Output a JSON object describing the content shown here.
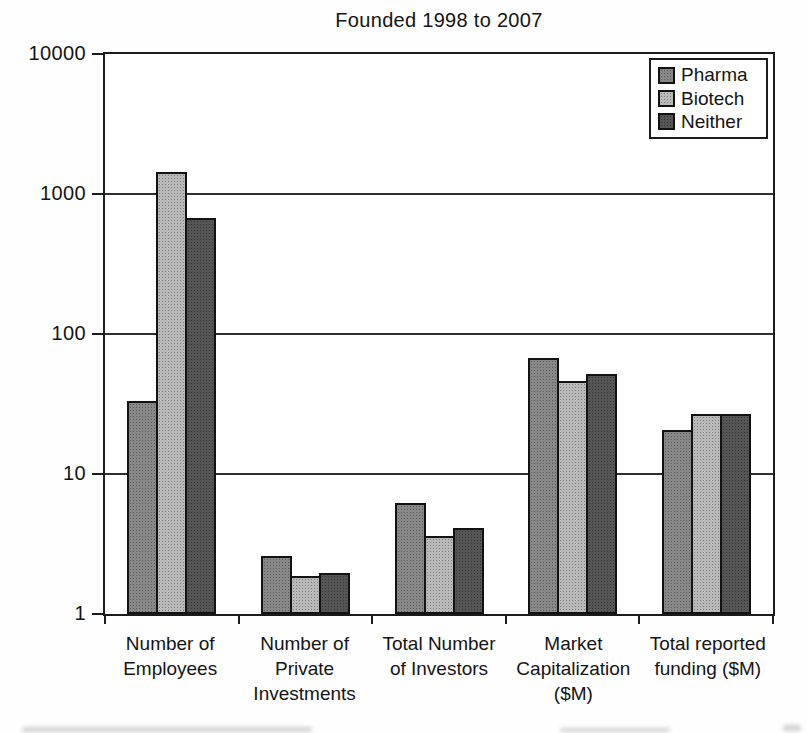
{
  "chart_data": {
    "type": "bar",
    "scale": "log",
    "title": "Founded 1998 to 2007",
    "categories": [
      "Number of Employees",
      "Number of Private Investments",
      "Total Number of Investors",
      "Market Capitalization ($M)",
      "Total reported funding ($M)"
    ],
    "category_lines": [
      [
        "Number of",
        "Employees"
      ],
      [
        "Number of",
        "Private",
        "Investments"
      ],
      [
        "Total Number",
        "of Investors"
      ],
      [
        "Market",
        "Capitalization",
        "($M)"
      ],
      [
        "Total reported",
        "funding ($M)"
      ]
    ],
    "series": [
      {
        "name": "Pharma",
        "color": "#838383",
        "values": [
          32,
          2.5,
          6,
          65,
          20
        ]
      },
      {
        "name": "Biotech",
        "color": "#b6b6b6",
        "values": [
          1400,
          1.8,
          3.5,
          45,
          26
        ]
      },
      {
        "name": "Neither",
        "color": "#4e4e4e",
        "values": [
          650,
          1.9,
          4,
          50,
          26
        ]
      }
    ],
    "ylim": [
      1,
      10000
    ],
    "yticks": [
      1,
      10,
      100,
      1000,
      10000
    ],
    "ytick_labels": [
      "1",
      "10",
      "100",
      "1000",
      "10000"
    ],
    "xlabel": "",
    "ylabel": "",
    "grid": true,
    "legend_position": "top-right"
  },
  "colors": {
    "axis": "#1c1c1c",
    "background": "#ffffff"
  }
}
